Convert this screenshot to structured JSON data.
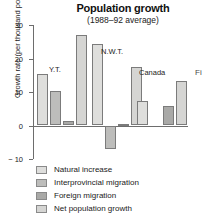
{
  "chart_data": {
    "type": "bar",
    "title": "Population growth",
    "subtitle": "(1988–92 average)",
    "xlabel": "",
    "ylabel": "Growth rate (per thousand population)",
    "ylim": [
      -10,
      30
    ],
    "yticks": [
      30,
      20,
      10,
      0,
      -10
    ],
    "ytick_labels": [
      "30",
      "20",
      "10",
      "0",
      "− 10"
    ],
    "grid": false,
    "legend_position": "below-plot",
    "categories": [
      "Y.T.",
      "N.W.T.",
      "Canada"
    ],
    "series": [
      {
        "name": "Natural increase",
        "values": [
          15.3,
          24.2,
          7.4
        ]
      },
      {
        "name": "Interprovincial migration",
        "values": [
          10.4,
          -7.0,
          0.0
        ]
      },
      {
        "name": "Foreign migration",
        "values": [
          1.4,
          0.5,
          5.9
        ]
      },
      {
        "name": "Net population growth",
        "values": [
          27.1,
          17.6,
          13.4
        ]
      }
    ],
    "group_labels": [
      "Y.T.",
      "N.W.T.",
      "Canada"
    ]
  },
  "legend": {
    "items": [
      {
        "label": "Natural increase",
        "swatch": "sw-natural"
      },
      {
        "label": "Interprovincial migration",
        "swatch": "sw-interprov"
      },
      {
        "label": "Foreign migration",
        "swatch": "sw-foreign"
      },
      {
        "label": "Net population growth",
        "swatch": "sw-net"
      }
    ]
  },
  "side_caption": "Fi"
}
